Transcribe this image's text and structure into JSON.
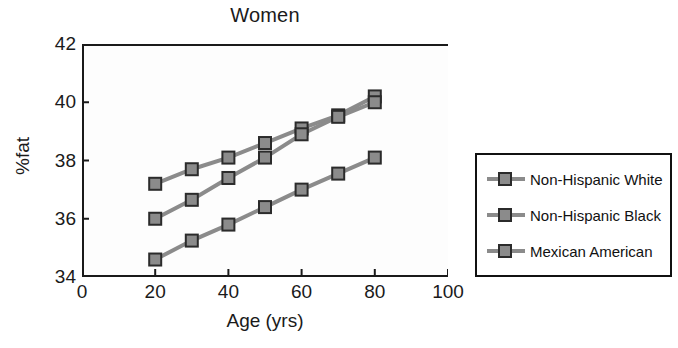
{
  "chart_data": {
    "type": "line",
    "title": "Women",
    "xlabel": "Age (yrs)",
    "ylabel": "%fat",
    "x": [
      20,
      30,
      40,
      50,
      60,
      70,
      80
    ],
    "xlim": [
      0,
      100
    ],
    "ylim": [
      34,
      42
    ],
    "xticks": [
      "0",
      "20",
      "40",
      "60",
      "80",
      "100"
    ],
    "yticks": [
      "34",
      "36",
      "38",
      "40",
      "42"
    ],
    "grid": false,
    "legend_position": "right-outside",
    "series": [
      {
        "name": "Non-Hispanic White",
        "values": [
          37.2,
          37.7,
          38.1,
          38.6,
          39.1,
          39.55,
          40.2
        ],
        "color": "#8b8b8b",
        "marker": "square"
      },
      {
        "name": "Non-Hispanic Black",
        "values": [
          36.0,
          36.65,
          37.4,
          38.1,
          38.9,
          39.5,
          40.0
        ],
        "color": "#8b8b8b",
        "marker": "square"
      },
      {
        "name": "Mexican American",
        "values": [
          34.6,
          35.25,
          35.8,
          36.4,
          37.0,
          37.55,
          38.1
        ],
        "color": "#8b8b8b",
        "marker": "square"
      }
    ]
  },
  "colors": {
    "series": "#8b8b8b",
    "marker_edge": "#2b2b2b",
    "axis": "#1a1a1a",
    "legend_border": "#111111",
    "background": "#ffffff"
  }
}
